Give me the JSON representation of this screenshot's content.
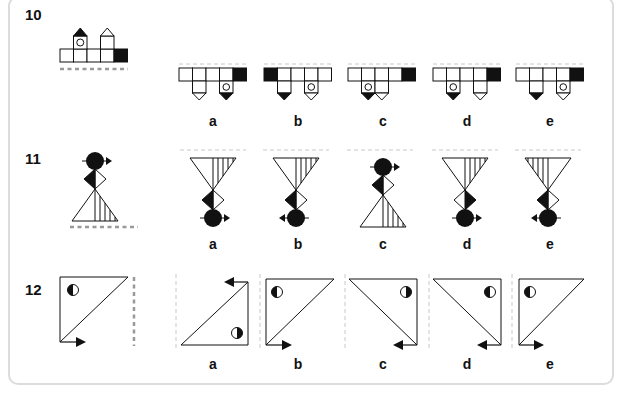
{
  "questions": [
    {
      "number": "10",
      "mirror_line": "horizontal-below",
      "options": [
        {
          "label": "a"
        },
        {
          "label": "b"
        },
        {
          "label": "c"
        },
        {
          "label": "d"
        },
        {
          "label": "e"
        }
      ]
    },
    {
      "number": "11",
      "mirror_line": "horizontal-below",
      "options": [
        {
          "label": "a"
        },
        {
          "label": "b"
        },
        {
          "label": "c"
        },
        {
          "label": "d"
        },
        {
          "label": "e"
        }
      ]
    },
    {
      "number": "12",
      "mirror_line": "vertical-right",
      "options": [
        {
          "label": "a"
        },
        {
          "label": "b"
        },
        {
          "label": "c"
        },
        {
          "label": "d"
        },
        {
          "label": "e"
        }
      ]
    }
  ],
  "colors": {
    "ink": "#111111",
    "mirror_line": "#999999",
    "option_mirror_line": "#c8c8c8",
    "panel_border": "#dcdcdc"
  }
}
